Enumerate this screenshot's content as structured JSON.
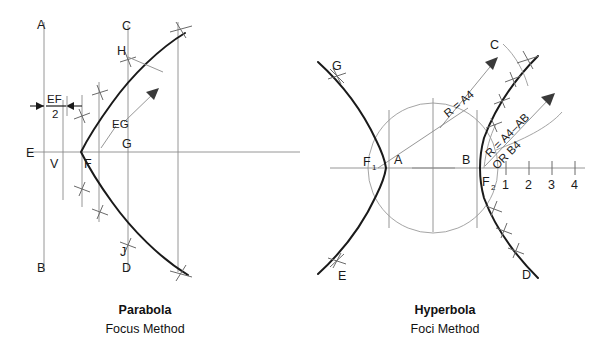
{
  "figures": [
    {
      "id": "parabola",
      "caption_title": "Parabola",
      "caption_sub": "Focus Method",
      "labels": {
        "a": "A",
        "b": "B",
        "c": "C",
        "d": "D",
        "e": "E",
        "v": "V",
        "f": "F",
        "g": "G",
        "h": "H",
        "j": "J",
        "ef": "EF",
        "two": "2",
        "eg": "EG"
      }
    },
    {
      "id": "hyperbola",
      "caption_title": "Hyperbola",
      "caption_sub": "Foci Method",
      "labels": {
        "g": "G",
        "e": "E",
        "c": "C",
        "d": "D",
        "a": "A",
        "b": "B",
        "f1": "F",
        "f1_sub": "1",
        "f2": "F",
        "f2_sub": "2",
        "r_a4": "R = A4",
        "r_a4_ab": "R = A4–AB",
        "or_b4": "OR B4"
      },
      "scale_ticks": [
        "1",
        "2",
        "3",
        "4"
      ]
    }
  ],
  "colors": {
    "curve": "#1a1a1a",
    "construction": "#8a8a8a",
    "background": "#ffffff",
    "text": "#111111"
  }
}
